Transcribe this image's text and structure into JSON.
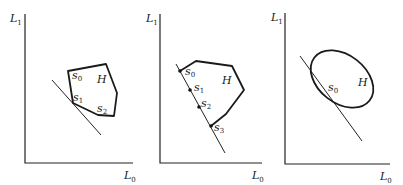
{
  "figure": {
    "panels": [
      {
        "id": "panel-1",
        "y_axis_label": "L",
        "y_axis_sub": "1",
        "x_axis_label": "L",
        "x_axis_sub": "0",
        "set_label": "H",
        "points": [
          {
            "label": "s",
            "sub": "0"
          },
          {
            "label": "s",
            "sub": "1"
          },
          {
            "label": "s",
            "sub": "2"
          }
        ]
      },
      {
        "id": "panel-2",
        "y_axis_label": "L",
        "y_axis_sub": "1",
        "x_axis_label": "L",
        "x_axis_sub": "0",
        "set_label": "H",
        "points": [
          {
            "label": "s",
            "sub": "0"
          },
          {
            "label": "s",
            "sub": "1"
          },
          {
            "label": "s",
            "sub": "2"
          },
          {
            "label": "s",
            "sub": "3"
          }
        ]
      },
      {
        "id": "panel-3",
        "y_axis_label": "L",
        "y_axis_sub": "1",
        "x_axis_label": "L",
        "x_axis_sub": "0",
        "set_label": "H",
        "points": [
          {
            "label": "s",
            "sub": "0"
          }
        ]
      }
    ]
  }
}
